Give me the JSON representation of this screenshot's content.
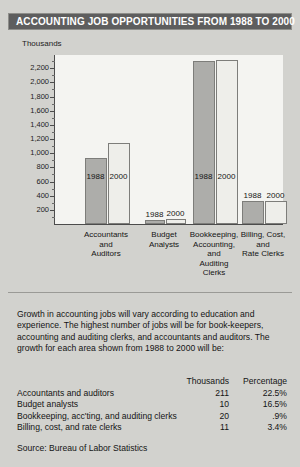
{
  "title": "ACCOUNTING JOB OPPORTUNITIES FROM 1988 TO 2000",
  "colors": {
    "header_bg": "#5e5e5e",
    "header_text": "#ffffff",
    "page_bg": "#d2d2ce",
    "plot_bg": "#f4f4f1",
    "bar_1988": "#adadaa",
    "bar_2000": "#eeeeea",
    "axis": "#4c4c4c"
  },
  "chart_data": {
    "type": "bar",
    "title": "ACCOUNTING JOB OPPORTUNITIES FROM 1988 TO 2000",
    "xlabel": "",
    "ylabel": "Thousands",
    "ylim": [
      0,
      2400
    ],
    "grid": false,
    "legend_position": "none",
    "tick_labels": [
      "200",
      "400",
      "600",
      "800",
      "1,000",
      "1,200",
      "1,400",
      "1,600",
      "1,800",
      "2,000",
      "2,200"
    ],
    "tick_values": [
      200,
      400,
      600,
      800,
      1000,
      1200,
      1400,
      1600,
      1800,
      2000,
      2200
    ],
    "categories": [
      "Accountants and Auditors",
      "Budget Analysts",
      "Bookkeeping, Accounting, and Auditing Clerks",
      "Billing, Cost, and Rate Clerks"
    ],
    "category_lines": [
      [
        "Accountants",
        "and",
        "Auditors"
      ],
      [
        "Budget",
        "Analysts"
      ],
      [
        "Bookkeeping,",
        "Accounting,",
        "and",
        "Auditing",
        "Clerks"
      ],
      [
        "Billing, Cost,",
        "and",
        "Rate Clerks"
      ]
    ],
    "series": [
      {
        "name": "1988",
        "values": [
          938,
          60,
          2300,
          318
        ]
      },
      {
        "name": "2000",
        "values": [
          1149,
          70,
          2320,
          329
        ]
      }
    ]
  },
  "body_text": "Growth in accounting jobs will vary according to education and experience.  The highest number of jobs will be for book-keepers, accounting and auditing clerks, and accountants and auditors.  The growth for each area shown from 1988 to 2000 will be:",
  "table": {
    "headers": [
      "",
      "Thousands",
      "Percentage"
    ],
    "rows": [
      {
        "name": "Accountants and auditors",
        "thousands": "211",
        "percentage": "22.5%"
      },
      {
        "name": "Budget analysts",
        "thousands": "10",
        "percentage": "16.5%"
      },
      {
        "name": "Bookkeeping, acc'ting, and auditing clerks",
        "thousands": "20",
        "percentage": ".9%"
      },
      {
        "name": "Billing, cost, and rate clerks",
        "thousands": "11",
        "percentage": "3.4%"
      }
    ]
  },
  "source": "Source: Bureau of Labor Statistics"
}
